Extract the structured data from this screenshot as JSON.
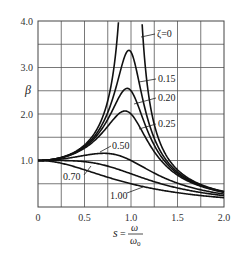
{
  "chart_data": {
    "type": "line",
    "title": "",
    "xlabel": "s = ω/ω0",
    "xlabel_parts": {
      "s": "s",
      "eq": "=",
      "num": "ω",
      "den": "ω",
      "den_sub": "0"
    },
    "ylabel": "β",
    "xlim": [
      0,
      2.0
    ],
    "ylim": [
      0,
      4.0
    ],
    "grid": true,
    "x_grid_step": 0.25,
    "y_grid_step": 0.5,
    "x_ticks": [
      {
        "value": 0,
        "label": "0"
      },
      {
        "value": 0.5,
        "label": "0.5"
      },
      {
        "value": 1.0,
        "label": "1.0"
      },
      {
        "value": 1.5,
        "label": "1.5"
      },
      {
        "value": 2.0,
        "label": "2.0"
      }
    ],
    "y_ticks": [
      {
        "value": 1.0,
        "label": "1.0"
      },
      {
        "value": 2.0,
        "label": "2.0"
      },
      {
        "value": 3.0,
        "label": "3.0"
      },
      {
        "value": 4.0,
        "label": "4.0"
      }
    ],
    "formula": "β = 1 / sqrt((1 - s²)² + (2ζs)²)",
    "series": [
      {
        "name": "ζ=0",
        "zeta": 0,
        "peak": {
          "s": 1.0,
          "beta": "∞"
        },
        "label": "ζ=0",
        "label_pos": [
          157,
          37
        ],
        "leader": [
          [
            141,
            37
          ],
          [
            155,
            34
          ]
        ]
      },
      {
        "name": "0.15",
        "zeta": 0.15,
        "peak": {
          "s": 0.98,
          "beta": 3.37
        },
        "label": "0.15",
        "label_pos": [
          158,
          82
        ],
        "leader": [
          [
            139,
            82
          ],
          [
            156,
            79
          ]
        ]
      },
      {
        "name": "0.20",
        "zeta": 0.2,
        "peak": {
          "s": 0.96,
          "beta": 2.55
        },
        "label": "0.20",
        "label_pos": [
          158,
          101
        ],
        "leader": [
          [
            134,
            104
          ],
          [
            156,
            98
          ]
        ]
      },
      {
        "name": "0.25",
        "zeta": 0.25,
        "peak": {
          "s": 0.94,
          "beta": 2.07
        },
        "label": "0.25",
        "label_pos": [
          158,
          127
        ],
        "leader": [
          [
            139,
            129
          ],
          [
            156,
            124
          ]
        ]
      },
      {
        "name": "0.50",
        "zeta": 0.5,
        "peak": {
          "s": 0.71,
          "beta": 1.15
        },
        "label": "0.50",
        "label_pos": [
          112,
          149
        ],
        "leader": [
          [
            100,
            152
          ],
          [
            111,
            146
          ]
        ]
      },
      {
        "name": "0.70",
        "zeta": 0.7,
        "peak": {
          "s": 0.14,
          "beta": 1.0
        },
        "label": "0.70",
        "label_pos": [
          63,
          180
        ],
        "leader": [
          [
            84,
            175
          ],
          [
            91,
            166
          ]
        ]
      },
      {
        "name": "1.00",
        "zeta": 1.0,
        "peak": {
          "s": 0,
          "beta": 1.0
        },
        "label": "1.00",
        "label_pos": [
          110,
          199
        ],
        "leader": [
          [
            127,
            193
          ],
          [
            143,
            187
          ]
        ]
      }
    ],
    "values_at_s": {
      "s": [
        0,
        0.25,
        0.5,
        0.75,
        1.0,
        1.25,
        1.5,
        1.75,
        2.0
      ],
      "zeta_0": [
        1.0,
        1.07,
        1.33,
        2.29,
        null,
        1.78,
        0.8,
        0.48,
        0.33
      ],
      "zeta_0.15": [
        1.0,
        1.06,
        1.3,
        2.02,
        3.33,
        1.59,
        0.76,
        0.46,
        0.32
      ],
      "zeta_0.20": [
        1.0,
        1.06,
        1.28,
        1.87,
        2.5,
        1.48,
        0.74,
        0.46,
        0.32
      ],
      "zeta_0.25": [
        1.0,
        1.06,
        1.26,
        1.72,
        2.0,
        1.36,
        0.72,
        0.45,
        0.32
      ],
      "zeta_0.50": [
        1.0,
        1.03,
        1.11,
        1.14,
        1.0,
        0.89,
        0.63,
        0.42,
        0.3
      ],
      "zeta_0.70": [
        1.0,
        0.99,
        0.97,
        0.89,
        0.71,
        0.62,
        0.52,
        0.38,
        0.28
      ],
      "zeta_1.00": [
        1.0,
        0.94,
        0.8,
        0.64,
        0.5,
        0.39,
        0.31,
        0.25,
        0.2
      ]
    }
  },
  "layout": {
    "plot_left": 38,
    "plot_right": 224,
    "plot_top": 21,
    "plot_bottom": 207
  }
}
